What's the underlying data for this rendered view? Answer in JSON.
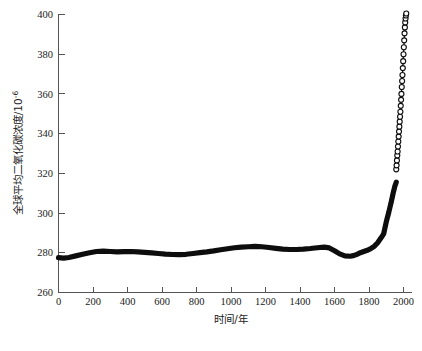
{
  "chart_data": {
    "type": "line",
    "title": "",
    "xlabel": "时间/年",
    "ylabel": "全球平均二氧化碳浓度/10",
    "ylabel_exponent": "-6",
    "xlim": [
      0,
      2050
    ],
    "ylim": [
      260,
      400
    ],
    "xticks": [
      0,
      200,
      400,
      600,
      800,
      1000,
      1200,
      1400,
      1600,
      1800,
      2000
    ],
    "xtick_labels": [
      "0",
      "200",
      "400",
      "600",
      "800",
      "1000",
      "1200",
      "1400",
      "1600",
      "1800",
      "2000"
    ],
    "yticks": [
      260,
      280,
      300,
      320,
      340,
      360,
      380,
      400
    ],
    "ytick_labels": [
      "260",
      "280",
      "300",
      "320",
      "340",
      "360",
      "380",
      "400"
    ],
    "grid": false,
    "legend": "none",
    "series": [
      {
        "name": "ice-core-record",
        "style": "thick-line",
        "color": "#0d0d0d",
        "x": [
          0,
          30,
          60,
          100,
          140,
          180,
          220,
          260,
          300,
          340,
          380,
          420,
          460,
          500,
          540,
          580,
          620,
          660,
          700,
          740,
          780,
          820,
          860,
          900,
          940,
          980,
          1020,
          1060,
          1100,
          1140,
          1180,
          1220,
          1260,
          1300,
          1340,
          1380,
          1420,
          1460,
          1500,
          1540,
          1570,
          1600,
          1630,
          1660,
          1690,
          1710,
          1730,
          1750,
          1770,
          1790,
          1810,
          1830,
          1850,
          1870,
          1885,
          1900,
          1915,
          1930,
          1940,
          1950,
          1958
        ],
        "y": [
          277.5,
          277.3,
          277.6,
          278.4,
          279.2,
          280.0,
          280.6,
          280.8,
          280.6,
          280.4,
          280.5,
          280.6,
          280.4,
          280.2,
          279.9,
          279.6,
          279.3,
          279.1,
          279.0,
          279.2,
          279.6,
          280.0,
          280.4,
          280.9,
          281.5,
          282.0,
          282.5,
          282.8,
          283.0,
          283.2,
          283.0,
          282.6,
          282.2,
          281.8,
          281.6,
          281.6,
          281.8,
          282.1,
          282.5,
          282.8,
          282.4,
          281.0,
          279.4,
          278.4,
          278.2,
          278.5,
          279.2,
          280.0,
          280.6,
          281.2,
          282.0,
          283.2,
          285.0,
          287.5,
          289.5,
          295.5,
          300.5,
          306.0,
          310.0,
          313.5,
          315.5
        ]
      },
      {
        "name": "instrumental-record",
        "style": "open-circle-markers",
        "marker": "o",
        "color": "#101010",
        "x": [
          1958,
          1960,
          1962,
          1964,
          1966,
          1968,
          1970,
          1972,
          1974,
          1976,
          1978,
          1980,
          1982,
          1984,
          1986,
          1988,
          1990,
          1992,
          1994,
          1996,
          1998,
          2000,
          2002,
          2004,
          2006,
          2008,
          2010,
          2012,
          2014,
          2016
        ],
        "y": [
          322.0,
          324.0,
          326.5,
          329.0,
          331.0,
          333.5,
          336.0,
          338.5,
          341.0,
          343.5,
          346.0,
          348.5,
          351.0,
          354.0,
          357.0,
          360.0,
          363.5,
          366.5,
          369.5,
          373.0,
          376.5,
          380.0,
          383.5,
          387.0,
          390.5,
          393.5,
          396.0,
          398.0,
          399.5,
          400.5
        ]
      }
    ]
  },
  "figure": {
    "caption_faint": "",
    "background": "#ffffff",
    "axis_color": "#555555",
    "line_color": "#0d0d0d"
  }
}
